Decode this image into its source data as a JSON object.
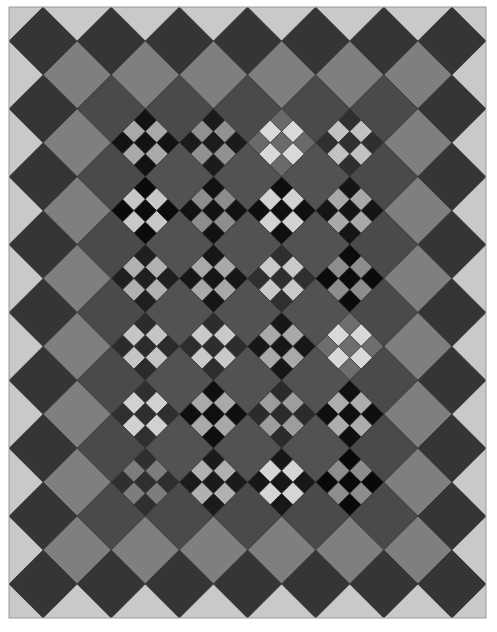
{
  "quilt": {
    "frame": {
      "x": 9,
      "y": 7,
      "width": 477,
      "height": 611,
      "cols": 14,
      "rows": 18
    },
    "colors": {
      "background": "#c9c9c9",
      "outer_ring": "#353535",
      "light_ring": "#7f7f7f",
      "middle_ring": "#4a4a4a",
      "setting_square": "#525252",
      "seam": "#2a2a2a",
      "border_line": "#9a9a9a"
    },
    "nine_patch": {
      "cols_i": [
        4,
        6,
        8,
        10
      ],
      "rows_j": [
        4,
        6,
        8,
        10,
        12,
        14
      ],
      "blocks": [
        [
          {
            "dark": "#121212",
            "light": "#a9a9a9"
          },
          {
            "dark": "#1b1b1b",
            "light": "#919191"
          },
          {
            "dark": "#6a6a6a",
            "light": "#d9d9d9"
          },
          {
            "dark": "#2f2f2f",
            "light": "#c2c2c2"
          }
        ],
        [
          {
            "dark": "#0b0b0b",
            "light": "#c8c8c8"
          },
          {
            "dark": "#121212",
            "light": "#8d8d8d"
          },
          {
            "dark": "#0f0f0f",
            "light": "#d2d2d2"
          },
          {
            "dark": "#151515",
            "light": "#a9a9a9"
          }
        ],
        [
          {
            "dark": "#1f1f1f",
            "light": "#b1b1b1"
          },
          {
            "dark": "#161616",
            "light": "#a9a9a9"
          },
          {
            "dark": "#2f2f2f",
            "light": "#c9c9c9"
          },
          {
            "dark": "#0b0b0b",
            "light": "#8d8d8d"
          }
        ],
        [
          {
            "dark": "#2b2b2b",
            "light": "#c5c5c5"
          },
          {
            "dark": "#2d2d2d",
            "light": "#c9c9c9"
          },
          {
            "dark": "#171717",
            "light": "#a9a9a9"
          },
          {
            "dark": "#6e6e6e",
            "light": "#d9d9d9"
          }
        ],
        [
          {
            "dark": "#2f2f2f",
            "light": "#d1d1d1"
          },
          {
            "dark": "#0f0f0f",
            "light": "#a9a9a9"
          },
          {
            "dark": "#2b2b2b",
            "light": "#9d9d9d"
          },
          {
            "dark": "#0f0f0f",
            "light": "#adadad"
          }
        ],
        [
          {
            "dark": "#2f2f2f",
            "light": "#7d7d7d"
          },
          {
            "dark": "#1b1b1b",
            "light": "#b1b1b1"
          },
          {
            "dark": "#171717",
            "light": "#d5d5d5"
          },
          {
            "dark": "#090909",
            "light": "#8d8d8d"
          }
        ]
      ]
    }
  }
}
